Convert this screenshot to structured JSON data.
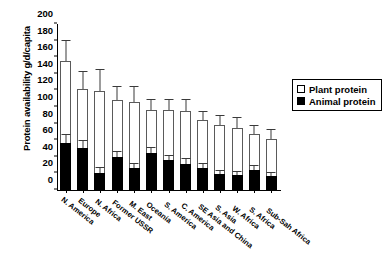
{
  "chart_data": {
    "type": "bar",
    "title": "",
    "subtitle": "",
    "xlabel": "",
    "ylabel": "Protein availability g/d/capita",
    "ylim": [
      0,
      200
    ],
    "yticks": [
      0,
      20,
      40,
      60,
      80,
      100,
      120,
      140,
      160,
      180,
      200
    ],
    "grid": false,
    "stacked": true,
    "legend_position": "right",
    "categories": [
      "N. America",
      "Europe",
      "N. Africa",
      "Former USSR",
      "M. East",
      "Oceania",
      "S. America",
      "C. America",
      "SE Asia and China",
      "S. Asia",
      "W. Africa",
      "S. Africa",
      "Sub-Sah Africa"
    ],
    "series": [
      {
        "name": "Animal protein",
        "color": "#000000",
        "values": [
          57,
          51,
          21,
          40,
          26,
          45,
          36,
          31,
          26,
          19,
          18,
          24,
          17
        ],
        "errors": [
          9,
          8,
          5,
          6,
          5,
          6,
          5,
          6,
          5,
          4,
          4,
          5,
          4
        ]
      },
      {
        "name": "Plant protein",
        "color": "#ffffff",
        "values": [
          98,
          71,
          98,
          68,
          80,
          51,
          60,
          64,
          58,
          59,
          57,
          43,
          44
        ],
        "errors": [
          0,
          0,
          0,
          0,
          0,
          0,
          0,
          0,
          0,
          0,
          0,
          0,
          0
        ]
      }
    ],
    "totals": [
      155,
      122,
      119,
      108,
      106,
      96,
      96,
      95,
      84,
      78,
      75,
      67,
      61
    ],
    "total_errors": [
      25,
      20,
      26,
      16,
      18,
      12,
      13,
      14,
      10,
      11,
      12,
      10,
      11
    ]
  },
  "legend": {
    "items": [
      {
        "label": "Plant protein",
        "swatch": "open-square"
      },
      {
        "label": "Animal protein",
        "swatch": "filled-square"
      }
    ]
  }
}
